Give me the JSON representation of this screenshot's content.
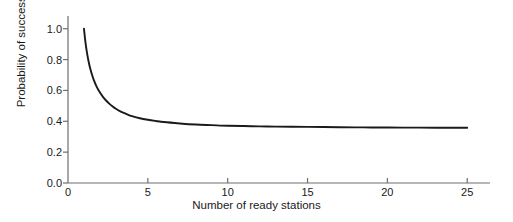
{
  "chart_data": {
    "type": "line",
    "title": "",
    "xlabel": "Number of ready stations",
    "ylabel": "Probability of success",
    "xlim": [
      0,
      25.3
    ],
    "ylim": [
      0.0,
      1.05
    ],
    "grid": false,
    "legend": null,
    "xticks": [
      "0",
      "5",
      "10",
      "15",
      "20",
      "25"
    ],
    "xtick_values": [
      0,
      5,
      10,
      15,
      20,
      25
    ],
    "yticks": [
      "0.0",
      "0.2",
      "0.4",
      "0.6",
      "0.8",
      "1.0"
    ],
    "ytick_values": [
      0.0,
      0.2,
      0.4,
      0.6,
      0.8,
      1.0
    ],
    "line_color": "#1a1a1a",
    "axis_color": "#6e6e6e",
    "series": [
      {
        "name": "Probability of success",
        "x": [
          1.0,
          1.1,
          1.2,
          1.3,
          1.4,
          1.5,
          1.6,
          1.8,
          2.0,
          2.2,
          2.4,
          2.6,
          2.8,
          3.0,
          3.25,
          3.5,
          3.75,
          4.0,
          4.5,
          5.0,
          5.5,
          6.0,
          7.0,
          8.0,
          9.0,
          10.0,
          11.0,
          12.0,
          13.0,
          14.0,
          15.0,
          16.0,
          17.0,
          18.0,
          19.0,
          20.0,
          21.0,
          22.0,
          23.0,
          24.0,
          25.0
        ],
        "y": [
          1.0,
          0.906,
          0.837,
          0.783,
          0.739,
          0.703,
          0.672,
          0.623,
          0.586,
          0.557,
          0.533,
          0.513,
          0.496,
          0.481,
          0.466,
          0.454,
          0.443,
          0.434,
          0.42,
          0.41,
          0.402,
          0.395,
          0.386,
          0.379,
          0.375,
          0.371,
          0.369,
          0.367,
          0.3655,
          0.3645,
          0.3635,
          0.3625,
          0.3615,
          0.3608,
          0.3602,
          0.3597,
          0.3592,
          0.3588,
          0.3584,
          0.3581,
          0.3578
        ]
      }
    ]
  },
  "layout": {
    "plot_left_px": 68,
    "plot_right_px": 472,
    "plot_axis_end_px": 490,
    "plot_top_px": 21,
    "plot_bottom_px": 183
  }
}
